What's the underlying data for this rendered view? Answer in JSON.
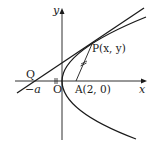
{
  "diagram": {
    "axes": {
      "x_label": "x",
      "y_label": "y",
      "origin_label": "O"
    },
    "points": {
      "Q": {
        "label": "Q"
      },
      "neg_a": {
        "label": "−a"
      },
      "A": {
        "label": "A(2,  0)"
      },
      "P": {
        "label": "P(x,  y)"
      }
    },
    "curves": [
      {
        "name": "parabola",
        "description": "parabola opening right with vertex at origin"
      },
      {
        "name": "tangent-line",
        "description": "line through Q tangent to parabola at P"
      },
      {
        "name": "segment-AP",
        "description": "segment from A to P with tick mark"
      }
    ],
    "colors": {
      "stroke": "#1a1a1a",
      "background": "#ffffff"
    }
  }
}
